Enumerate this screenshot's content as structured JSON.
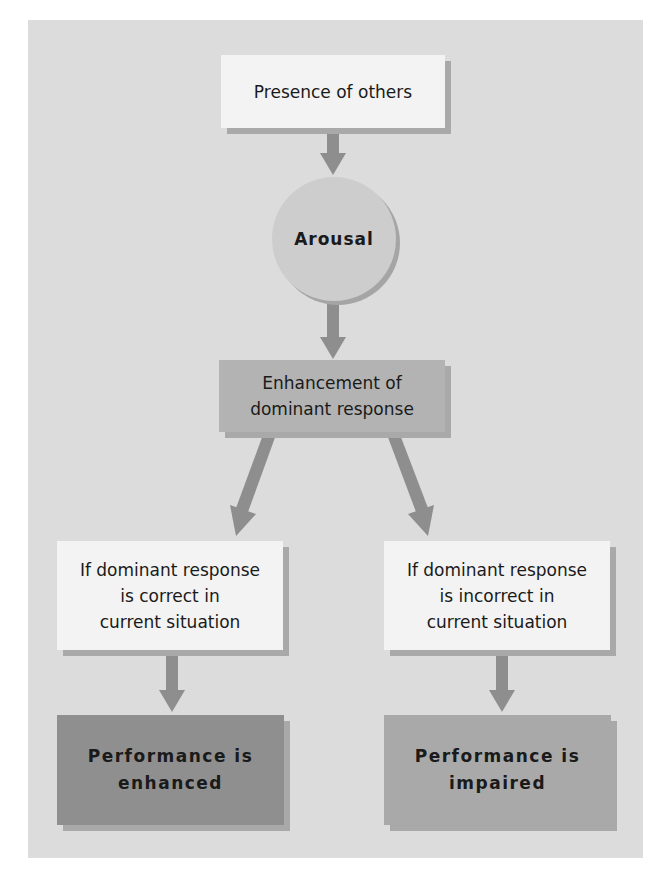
{
  "diagram": {
    "title": "",
    "nodes": {
      "presence": {
        "label": "Presence of others"
      },
      "arousal": {
        "label": "Arousal"
      },
      "enhancement": {
        "line1": "Enhancement of",
        "line2": "dominant response"
      },
      "correct": {
        "line1": "If dominant response",
        "line2": "is correct in",
        "line3": "current situation"
      },
      "incorrect": {
        "line1": "If dominant response",
        "line2": "is incorrect in",
        "line3": "current situation"
      },
      "enhanced": {
        "line1": "Performance is",
        "line2": "enhanced"
      },
      "impaired": {
        "line1": "Performance is",
        "line2": "impaired"
      }
    },
    "edges": [
      {
        "from": "presence",
        "to": "arousal"
      },
      {
        "from": "arousal",
        "to": "enhancement"
      },
      {
        "from": "enhancement",
        "to": "correct"
      },
      {
        "from": "enhancement",
        "to": "incorrect"
      },
      {
        "from": "correct",
        "to": "enhanced"
      },
      {
        "from": "incorrect",
        "to": "impaired"
      }
    ],
    "colors": {
      "panel": "#dcdcdc",
      "light_box": "#f3f3f3",
      "mid_box": "#b3b3b3",
      "circle": "#cdcdcd",
      "enhanced_box": "#8f8f8f",
      "impaired_box": "#a9a9a9",
      "arrow": "#8e8e8e"
    }
  }
}
